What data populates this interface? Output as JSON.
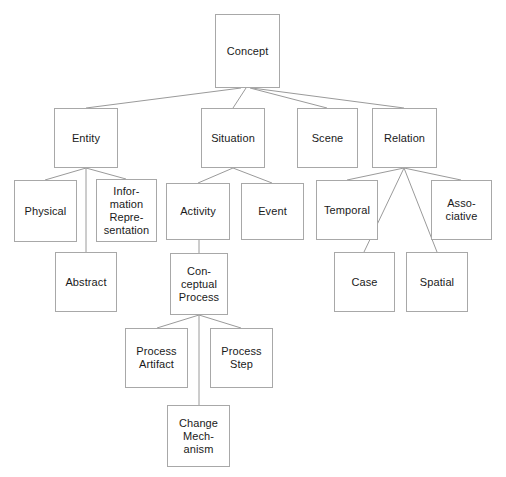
{
  "diagram": {
    "type": "hierarchy-tree",
    "canvas": {
      "width": 506,
      "height": 477
    },
    "style": {
      "background": "#ffffff",
      "box_fill": "#ffffff",
      "box_border": "#a8a8a8",
      "edge_color": "#9a9a9a",
      "text_color": "#1a1a1a"
    },
    "nodes": [
      {
        "id": "concept",
        "label": "Concept",
        "x": 215,
        "y": 14,
        "w": 65,
        "h": 74,
        "level": 0
      },
      {
        "id": "entity",
        "label": "Entity",
        "x": 54,
        "y": 108,
        "w": 64,
        "h": 60,
        "level": 1
      },
      {
        "id": "situation",
        "label": "Situation",
        "x": 201,
        "y": 108,
        "w": 64,
        "h": 60,
        "level": 1
      },
      {
        "id": "scene",
        "label": "Scene",
        "x": 297,
        "y": 108,
        "w": 61,
        "h": 60,
        "level": 1
      },
      {
        "id": "relation",
        "label": "Relation",
        "x": 372,
        "y": 108,
        "w": 65,
        "h": 60,
        "level": 1
      },
      {
        "id": "physical",
        "label": "Physical",
        "x": 14,
        "y": 180,
        "w": 63,
        "h": 62,
        "level": 2
      },
      {
        "id": "info_rep",
        "label": "Infor-\nmation\nRepre-\nsentation",
        "x": 96,
        "y": 179,
        "w": 61,
        "h": 63,
        "level": 2
      },
      {
        "id": "activity",
        "label": "Activity",
        "x": 166,
        "y": 183,
        "w": 64,
        "h": 57,
        "level": 2
      },
      {
        "id": "event",
        "label": "Event",
        "x": 241,
        "y": 183,
        "w": 63,
        "h": 57,
        "level": 2
      },
      {
        "id": "temporal",
        "label": "Temporal",
        "x": 316,
        "y": 180,
        "w": 62,
        "h": 60,
        "level": 2
      },
      {
        "id": "associative",
        "label": "Asso-\nciative",
        "x": 431,
        "y": 180,
        "w": 61,
        "h": 60,
        "level": 2
      },
      {
        "id": "abstract",
        "label": "Abstract",
        "x": 55,
        "y": 252,
        "w": 62,
        "h": 60,
        "level": 3
      },
      {
        "id": "conceptual",
        "label": "Con-\nceptual\nProcess",
        "x": 170,
        "y": 253,
        "w": 58,
        "h": 62,
        "level": 3
      },
      {
        "id": "case",
        "label": "Case",
        "x": 334,
        "y": 252,
        "w": 61,
        "h": 60,
        "level": 3
      },
      {
        "id": "spatial",
        "label": "Spatial",
        "x": 406,
        "y": 252,
        "w": 62,
        "h": 60,
        "level": 3
      },
      {
        "id": "proc_artifact",
        "label": "Process\nArtifact",
        "x": 125,
        "y": 328,
        "w": 63,
        "h": 60,
        "level": 4
      },
      {
        "id": "proc_step",
        "label": "Process\nStep",
        "x": 210,
        "y": 328,
        "w": 63,
        "h": 60,
        "level": 4
      },
      {
        "id": "change_mech",
        "label": "Change\nMech-\nanism",
        "x": 167,
        "y": 405,
        "w": 63,
        "h": 62,
        "level": 5
      }
    ],
    "edges": [
      {
        "from": "concept",
        "to": "entity",
        "x1": 241,
        "y1": 88,
        "x2": 86,
        "y2": 108
      },
      {
        "from": "concept",
        "to": "situation",
        "x1": 246,
        "y1": 88,
        "x2": 233,
        "y2": 108
      },
      {
        "from": "concept",
        "to": "scene",
        "x1": 250,
        "y1": 88,
        "x2": 327,
        "y2": 108
      },
      {
        "from": "concept",
        "to": "relation",
        "x1": 252,
        "y1": 88,
        "x2": 404,
        "y2": 108
      },
      {
        "from": "entity",
        "to": "physical",
        "x1": 86,
        "y1": 168,
        "x2": 45,
        "y2": 180
      },
      {
        "from": "entity",
        "to": "abstract",
        "x1": 86,
        "y1": 168,
        "x2": 86,
        "y2": 252
      },
      {
        "from": "entity",
        "to": "info_rep",
        "x1": 86,
        "y1": 168,
        "x2": 126,
        "y2": 179
      },
      {
        "from": "situation",
        "to": "activity",
        "x1": 233,
        "y1": 168,
        "x2": 198,
        "y2": 183
      },
      {
        "from": "situation",
        "to": "event",
        "x1": 233,
        "y1": 168,
        "x2": 272,
        "y2": 183
      },
      {
        "from": "relation",
        "to": "temporal",
        "x1": 404,
        "y1": 168,
        "x2": 347,
        "y2": 180
      },
      {
        "from": "relation",
        "to": "case",
        "x1": 404,
        "y1": 168,
        "x2": 364,
        "y2": 252
      },
      {
        "from": "relation",
        "to": "spatial",
        "x1": 404,
        "y1": 168,
        "x2": 437,
        "y2": 252
      },
      {
        "from": "relation",
        "to": "associative",
        "x1": 404,
        "y1": 168,
        "x2": 461,
        "y2": 180
      },
      {
        "from": "activity",
        "to": "conceptual",
        "x1": 199,
        "y1": 240,
        "x2": 199,
        "y2": 253
      },
      {
        "from": "conceptual",
        "to": "proc_artifact",
        "x1": 199,
        "y1": 315,
        "x2": 157,
        "y2": 328
      },
      {
        "from": "conceptual",
        "to": "change_mech",
        "x1": 199,
        "y1": 315,
        "x2": 199,
        "y2": 405
      },
      {
        "from": "conceptual",
        "to": "proc_step",
        "x1": 199,
        "y1": 315,
        "x2": 241,
        "y2": 328
      }
    ]
  }
}
